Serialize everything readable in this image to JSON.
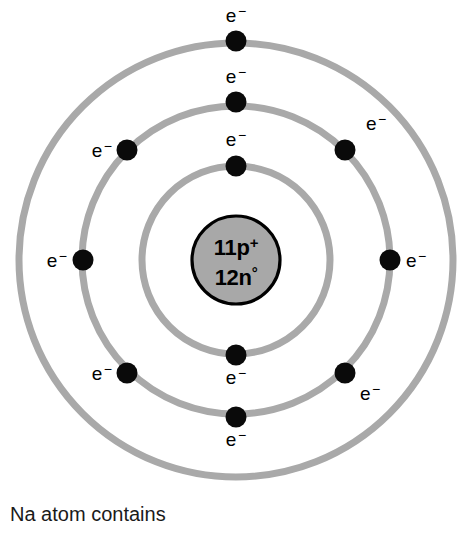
{
  "diagram": {
    "type": "bohr-atom-shell-diagram",
    "center": {
      "x": 236,
      "y": 260
    },
    "colors": {
      "ring": "#a9a9a9",
      "nucleus_fill": "#a8a8a8",
      "nucleus_border": "#000000",
      "electron": "#0a0a0a",
      "background": "#ffffff",
      "text": "#000000"
    },
    "nucleus": {
      "radius": 44,
      "protons_label": "11p",
      "protons_charge": "+",
      "neutrons_label": "12n",
      "neutrons_charge": "°",
      "proton_count": 11,
      "neutron_count": 12
    },
    "electron_symbol": "e",
    "electron_charge": "−",
    "electron_dot_radius": 10.5,
    "shells": [
      {
        "name": "shell-1-inner",
        "radius": 94,
        "electron_count": 2,
        "electrons": [
          {
            "name": "electron-inner-top",
            "x": 236,
            "y": 166,
            "label_x": 236,
            "label_y": 146,
            "anchor": "middle"
          },
          {
            "name": "electron-inner-bottom",
            "x": 236,
            "y": 355,
            "label_x": 236,
            "label_y": 384,
            "anchor": "middle"
          }
        ]
      },
      {
        "name": "shell-2-middle",
        "radius": 154,
        "electron_count": 8,
        "electrons": [
          {
            "name": "electron-middle-top",
            "x": 236,
            "y": 102,
            "label_x": 236,
            "label_y": 83,
            "anchor": "middle"
          },
          {
            "name": "electron-middle-upper-right",
            "x": 345,
            "y": 150,
            "label_x": 366,
            "label_y": 130,
            "anchor": "start"
          },
          {
            "name": "electron-middle-right",
            "x": 390,
            "y": 260,
            "label_x": 406,
            "label_y": 267,
            "anchor": "start"
          },
          {
            "name": "electron-middle-lower-right",
            "x": 345,
            "y": 373,
            "label_x": 360,
            "label_y": 400,
            "anchor": "start"
          },
          {
            "name": "electron-middle-bottom",
            "x": 236,
            "y": 417,
            "label_x": 236,
            "label_y": 446,
            "anchor": "middle"
          },
          {
            "name": "electron-middle-lower-left",
            "x": 127,
            "y": 373,
            "label_x": 112,
            "label_y": 380,
            "anchor": "end"
          },
          {
            "name": "electron-middle-left",
            "x": 83,
            "y": 260,
            "label_x": 67,
            "label_y": 267,
            "anchor": "end"
          },
          {
            "name": "electron-middle-upper-left",
            "x": 127,
            "y": 150,
            "label_x": 112,
            "label_y": 157,
            "anchor": "end"
          }
        ]
      },
      {
        "name": "shell-3-outer",
        "radius": 217,
        "electron_count": 1,
        "electrons": [
          {
            "name": "electron-outer-top",
            "x": 236,
            "y": 41,
            "label_x": 236,
            "label_y": 22,
            "anchor": "middle"
          }
        ]
      }
    ]
  },
  "caption": {
    "line1": "Na atom contains"
  }
}
